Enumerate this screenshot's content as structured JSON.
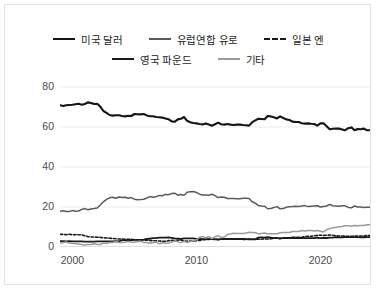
{
  "legend": {
    "rows": [
      [
        {
          "label": "미국 달러",
          "color": "#141414",
          "style": "solid",
          "width": 2.8,
          "key": "usd"
        },
        {
          "label": "유럽연합 유로",
          "color": "#5b5b5b",
          "style": "solid",
          "width": 2.2,
          "key": "eur"
        },
        {
          "label": "일본 엔",
          "color": "#1a1a1a",
          "style": "dashed",
          "width": 2.6,
          "key": "jpy"
        }
      ],
      [
        {
          "label": "영국 파운드",
          "color": "#1a1a1a",
          "style": "solid",
          "width": 2.4,
          "key": "gbp"
        },
        {
          "label": "기타",
          "color": "#9a9a9a",
          "style": "solid",
          "width": 2.0,
          "key": "other"
        }
      ]
    ]
  },
  "axes": {
    "y_ticks": [
      "0",
      "20",
      "40",
      "60",
      "80"
    ],
    "x_ticks": [
      "2000",
      "2010",
      "2020"
    ],
    "xlim": [
      1999.0,
      2024.0
    ],
    "ylim": [
      0,
      86
    ],
    "grid": true,
    "grid_color": "#ececec",
    "axis_color": "#c9c9c9"
  },
  "chart_data": {
    "type": "line",
    "title": "",
    "xlabel": "",
    "ylabel": "",
    "xlim": [
      1999.0,
      2024.0
    ],
    "ylim": [
      0,
      86
    ],
    "ytick_values": [
      0,
      20,
      40,
      60,
      80
    ],
    "xtick_values": [
      2000,
      2010,
      2020
    ],
    "grid": true,
    "legend_position": "top",
    "x": [
      1999.0,
      1999.25,
      1999.5,
      1999.75,
      2000.0,
      2000.25,
      2000.5,
      2000.75,
      2001.0,
      2001.25,
      2001.5,
      2001.75,
      2002.0,
      2002.25,
      2002.5,
      2002.75,
      2003.0,
      2003.25,
      2003.5,
      2003.75,
      2004.0,
      2004.25,
      2004.5,
      2004.75,
      2005.0,
      2005.25,
      2005.5,
      2005.75,
      2006.0,
      2006.25,
      2006.5,
      2006.75,
      2007.0,
      2007.25,
      2007.5,
      2007.75,
      2008.0,
      2008.25,
      2008.5,
      2008.75,
      2009.0,
      2009.25,
      2009.5,
      2009.75,
      2010.0,
      2010.25,
      2010.5,
      2010.75,
      2011.0,
      2011.25,
      2011.5,
      2011.75,
      2012.0,
      2012.25,
      2012.5,
      2012.75,
      2013.0,
      2013.25,
      2013.5,
      2013.75,
      2014.0,
      2014.25,
      2014.5,
      2014.75,
      2015.0,
      2015.25,
      2015.5,
      2015.75,
      2016.0,
      2016.25,
      2016.5,
      2016.75,
      2017.0,
      2017.25,
      2017.5,
      2017.75,
      2018.0,
      2018.25,
      2018.5,
      2018.75,
      2019.0,
      2019.25,
      2019.5,
      2019.75,
      2020.0,
      2020.25,
      2020.5,
      2020.75,
      2021.0,
      2021.25,
      2021.5,
      2021.75,
      2022.0,
      2022.25,
      2022.5,
      2022.75,
      2023.0,
      2023.25,
      2023.5,
      2023.75,
      2024.0
    ],
    "series": [
      {
        "name": "미국 달러",
        "color": "#141414",
        "style": "solid",
        "width": 2.1,
        "values": [
          70.9,
          70.5,
          70.9,
          71.0,
          71.1,
          71.4,
          71.6,
          71.1,
          71.5,
          72.3,
          72.0,
          71.5,
          71.6,
          70.2,
          68.0,
          67.1,
          66.0,
          65.7,
          65.9,
          65.9,
          65.5,
          65.3,
          65.6,
          65.5,
          66.5,
          66.4,
          66.3,
          66.5,
          65.8,
          65.4,
          65.4,
          65.0,
          64.9,
          64.7,
          64.3,
          63.9,
          62.8,
          62.6,
          63.8,
          64.1,
          65.0,
          63.1,
          62.4,
          62.0,
          61.8,
          61.5,
          61.3,
          61.8,
          61.2,
          60.6,
          61.4,
          62.2,
          61.4,
          61.2,
          61.5,
          61.2,
          61.0,
          61.2,
          61.2,
          61.0,
          60.9,
          60.7,
          62.4,
          63.3,
          64.1,
          64.0,
          63.9,
          65.5,
          65.3,
          64.9,
          64.3,
          65.3,
          64.5,
          63.8,
          63.5,
          62.7,
          62.5,
          62.5,
          61.9,
          61.7,
          61.8,
          61.6,
          61.5,
          60.7,
          61.8,
          61.9,
          60.4,
          58.9,
          59.1,
          59.2,
          59.2,
          58.8,
          58.4,
          59.4,
          59.8,
          58.4,
          59.0,
          58.9,
          59.2,
          58.4,
          58.4
        ]
      },
      {
        "name": "유럽연합 유로",
        "color": "#5b5b5b",
        "style": "solid",
        "width": 1.5,
        "values": [
          17.9,
          18.1,
          17.7,
          17.7,
          18.3,
          17.9,
          18.0,
          18.8,
          19.2,
          18.6,
          19.0,
          19.2,
          19.5,
          21.0,
          22.6,
          23.8,
          24.6,
          24.9,
          24.4,
          25.0,
          24.8,
          24.9,
          24.4,
          24.7,
          23.9,
          23.6,
          23.7,
          23.9,
          24.5,
          25.2,
          24.9,
          25.1,
          25.8,
          25.6,
          26.3,
          26.1,
          26.8,
          26.9,
          25.9,
          26.2,
          25.9,
          27.4,
          27.6,
          27.7,
          27.3,
          26.4,
          26.0,
          26.0,
          25.9,
          26.4,
          25.7,
          24.7,
          25.0,
          24.9,
          24.2,
          24.2,
          24.2,
          24.1,
          24.1,
          24.4,
          24.4,
          24.2,
          22.6,
          21.9,
          20.7,
          20.5,
          20.4,
          19.1,
          19.3,
          19.7,
          20.2,
          19.1,
          19.2,
          19.9,
          20.1,
          20.2,
          20.4,
          20.3,
          20.5,
          20.7,
          20.2,
          20.4,
          20.5,
          20.6,
          20.0,
          20.3,
          20.5,
          21.3,
          20.6,
          20.5,
          20.4,
          20.6,
          20.6,
          19.8,
          19.6,
          20.5,
          20.0,
          20.0,
          19.8,
          19.9,
          19.9
        ]
      },
      {
        "name": "일본 엔",
        "color": "#1a1a1a",
        "style": "dashed",
        "width": 1.6,
        "values": [
          6.4,
          6.3,
          6.1,
          6.4,
          6.1,
          6.2,
          6.1,
          6.1,
          5.6,
          5.2,
          5.0,
          5.0,
          4.9,
          4.8,
          4.6,
          4.5,
          4.4,
          4.3,
          4.1,
          4.0,
          4.0,
          3.9,
          3.8,
          3.9,
          3.6,
          3.6,
          3.5,
          3.6,
          3.4,
          3.3,
          3.1,
          3.1,
          3.0,
          2.9,
          2.8,
          3.2,
          3.3,
          3.2,
          3.4,
          3.5,
          3.0,
          2.9,
          3.0,
          2.9,
          3.2,
          3.3,
          3.6,
          3.7,
          3.8,
          3.9,
          4.0,
          3.6,
          3.9,
          3.9,
          4.0,
          4.1,
          3.9,
          3.9,
          3.9,
          3.8,
          3.8,
          3.8,
          3.9,
          3.9,
          3.9,
          3.9,
          4.0,
          4.0,
          4.1,
          4.4,
          4.5,
          4.2,
          4.6,
          4.6,
          4.6,
          4.9,
          4.9,
          4.9,
          4.9,
          5.2,
          5.3,
          5.4,
          5.6,
          5.8,
          5.9,
          5.8,
          5.9,
          6.0,
          5.9,
          5.6,
          5.5,
          5.5,
          5.4,
          5.3,
          5.3,
          5.5,
          5.5,
          5.5,
          5.4,
          5.7,
          5.7
        ]
      },
      {
        "name": "영국 파운드",
        "color": "#1a1a1a",
        "style": "solid",
        "width": 1.8,
        "values": [
          2.9,
          2.9,
          2.8,
          2.9,
          2.8,
          2.8,
          2.8,
          2.8,
          2.7,
          2.7,
          2.7,
          2.7,
          2.8,
          2.8,
          2.8,
          2.8,
          2.8,
          2.8,
          2.9,
          2.8,
          3.4,
          3.4,
          3.4,
          3.4,
          3.6,
          3.6,
          3.6,
          3.7,
          4.0,
          4.2,
          4.4,
          4.4,
          4.7,
          4.7,
          4.7,
          4.8,
          4.6,
          4.3,
          4.2,
          4.0,
          4.3,
          4.3,
          4.3,
          4.3,
          4.1,
          4.0,
          3.9,
          3.9,
          3.9,
          3.9,
          3.8,
          3.8,
          3.9,
          4.0,
          4.1,
          4.0,
          4.0,
          4.0,
          4.0,
          4.0,
          3.9,
          3.9,
          3.8,
          3.8,
          4.7,
          4.8,
          4.7,
          4.9,
          4.7,
          4.4,
          4.4,
          4.3,
          4.4,
          4.5,
          4.5,
          4.5,
          4.4,
          4.5,
          4.5,
          4.4,
          4.4,
          4.4,
          4.4,
          4.7,
          4.4,
          4.5,
          4.5,
          4.7,
          4.7,
          4.9,
          4.8,
          4.8,
          5.0,
          4.9,
          4.9,
          4.9,
          4.9,
          4.8,
          4.8,
          4.9,
          4.9
        ]
      },
      {
        "name": "기타",
        "color": "#9a9a9a",
        "style": "solid",
        "width": 1.5,
        "values": [
          1.9,
          2.2,
          2.5,
          2.0,
          1.7,
          1.7,
          1.5,
          1.2,
          1.0,
          1.2,
          1.3,
          1.6,
          1.2,
          1.2,
          2.0,
          1.8,
          2.2,
          2.3,
          2.7,
          2.3,
          2.3,
          2.5,
          2.8,
          2.5,
          2.4,
          2.8,
          2.9,
          2.3,
          2.3,
          1.9,
          2.2,
          2.4,
          1.6,
          2.1,
          1.9,
          2.0,
          2.5,
          3.0,
          2.7,
          2.2,
          2.8,
          2.3,
          2.7,
          3.1,
          3.6,
          4.8,
          5.2,
          4.6,
          5.2,
          4.2,
          5.1,
          5.7,
          4.8,
          5.0,
          6.2,
          6.5,
          6.9,
          6.8,
          6.8,
          6.8,
          7.0,
          7.4,
          7.3,
          7.1,
          6.6,
          6.8,
          7.0,
          6.5,
          6.6,
          6.6,
          6.6,
          7.1,
          7.3,
          7.2,
          7.3,
          7.7,
          7.8,
          7.8,
          8.2,
          8.0,
          8.3,
          8.2,
          8.0,
          8.2,
          7.9,
          7.5,
          8.7,
          9.1,
          9.7,
          9.8,
          10.1,
          10.3,
          10.6,
          10.6,
          10.4,
          10.7,
          10.6,
          10.8,
          10.8,
          11.1,
          11.1
        ]
      }
    ]
  }
}
